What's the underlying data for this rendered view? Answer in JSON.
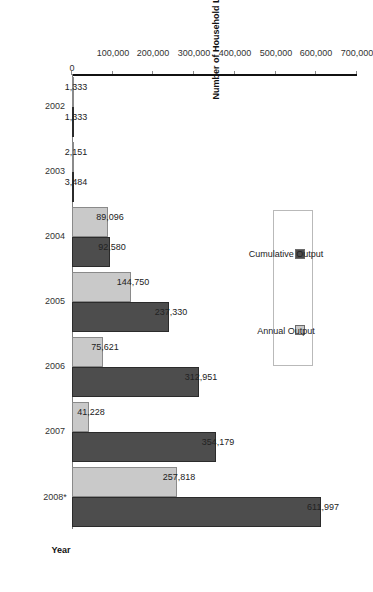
{
  "chart_data": {
    "type": "bar",
    "orientation": "vertical-rotated",
    "title": "",
    "xlabel": "Year",
    "ylabel": "Number of Household Latrines",
    "categories": [
      "2002",
      "2003",
      "2004",
      "2005",
      "2006",
      "2007",
      "2008*"
    ],
    "series": [
      {
        "name": "Annual Output",
        "color": "#c9c9c9",
        "values": [
          1333,
          2151,
          89096,
          144750,
          75621,
          41228,
          257818
        ],
        "labels": [
          "1,333",
          "2,151",
          "89,096",
          "144,750",
          "75,621",
          "41,228",
          "257,818"
        ]
      },
      {
        "name": "Cumulative Output",
        "color": "#4d4d4d",
        "values": [
          1333,
          3484,
          92580,
          237330,
          312951,
          354179,
          611997
        ],
        "labels": [
          "1,333",
          "3,484",
          "92,580",
          "237,330",
          "312,951",
          "354,179",
          "611,997"
        ]
      }
    ],
    "ylim": [
      0,
      700000
    ],
    "yticks": [
      0,
      100000,
      200000,
      300000,
      400000,
      500000,
      600000,
      700000
    ],
    "ytick_labels": [
      "0",
      "100,000",
      "200,000",
      "300,000",
      "400,000",
      "500,000",
      "600,000",
      "700,000"
    ],
    "grid": false,
    "legend_position": "upper-left"
  },
  "legend": {
    "items": [
      {
        "label": "Annual Output",
        "swatch": "annual"
      },
      {
        "label": "Cumulative Output",
        "swatch": "cumul"
      }
    ]
  }
}
